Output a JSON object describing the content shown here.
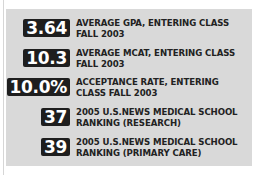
{
  "colors": {
    "panel": "#d9d9d9",
    "badge": "#1e1e1e",
    "badge_text": "#ffffff",
    "label_text": "#222222"
  },
  "stats": [
    {
      "value": "3.64",
      "line1": "AVERAGE GPA, ENTERING CLASS",
      "line2": "FALL 2003"
    },
    {
      "value": "10.3",
      "line1": "AVERAGE MCAT, ENTERING CLASS",
      "line2": "FALL 2003"
    },
    {
      "value": "10.0%",
      "line1": "ACCEPTANCE RATE, ENTERING",
      "line2": "CLASS FALL 2003"
    },
    {
      "value": "37",
      "line1": "2005 U.S.NEWS MEDICAL SCHOOL",
      "line2": "RANKING (RESEARCH)"
    },
    {
      "value": "39",
      "line1": "2005 U.S.NEWS MEDICAL SCHOOL",
      "line2": "RANKING (PRIMARY CARE)"
    }
  ]
}
